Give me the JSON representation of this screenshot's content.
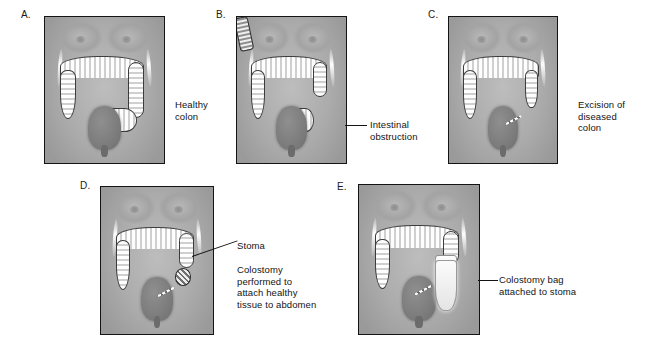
{
  "figure": {
    "background_color": "#ffffff",
    "text_color": "#141414",
    "frame_color": "#141414"
  },
  "panels": [
    {
      "id": "a",
      "letter": "A.",
      "stage": "healthy-colon",
      "annotations": [
        {
          "name": "healthy-colon-label",
          "text": "Healthy\ncolon",
          "leader": false
        }
      ]
    },
    {
      "id": "b",
      "letter": "B.",
      "stage": "intestinal-obstruction",
      "annotations": [
        {
          "name": "intestinal-obstruction-label",
          "text": "Intestinal\nobstruction",
          "leader": true
        }
      ]
    },
    {
      "id": "c",
      "letter": "C.",
      "stage": "excision-of-diseased-colon",
      "annotations": [
        {
          "name": "excision-label",
          "text": "Excision of\ndiseased\ncolon",
          "leader": false
        }
      ]
    },
    {
      "id": "d",
      "letter": "D.",
      "stage": "colostomy-stoma-created",
      "annotations": [
        {
          "name": "stoma-label",
          "text": "Stoma",
          "leader": true
        },
        {
          "name": "colostomy-description-label",
          "text": "Colostomy\nperformed to\nattach healthy\ntissue to abdomen",
          "leader": false
        }
      ]
    },
    {
      "id": "e",
      "letter": "E.",
      "stage": "colostomy-bag-attached",
      "annotations": [
        {
          "name": "colostomy-bag-label",
          "text": "Colostomy bag\nattached to stoma",
          "leader": true
        }
      ]
    }
  ]
}
